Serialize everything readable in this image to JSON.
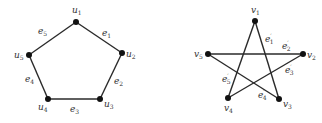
{
  "graphs": [
    {
      "name": "pentagon",
      "nodes": [
        {
          "id": "u1",
          "base": "u",
          "sub": "1",
          "x": 76,
          "y": 22,
          "lx": 72,
          "ly": 13
        },
        {
          "id": "u2",
          "base": "u",
          "sub": "2",
          "x": 122,
          "y": 53,
          "lx": 126,
          "ly": 57
        },
        {
          "id": "u3",
          "base": "u",
          "sub": "3",
          "x": 100,
          "y": 99,
          "lx": 104,
          "ly": 107
        },
        {
          "id": "u4",
          "base": "u",
          "sub": "4",
          "x": 48,
          "y": 99,
          "lx": 38,
          "ly": 110
        },
        {
          "id": "u5",
          "base": "u",
          "sub": "5",
          "x": 29,
          "y": 55,
          "lx": 14,
          "ly": 58
        }
      ],
      "edges": [
        {
          "from": "u1",
          "to": "u2",
          "base": "e",
          "sub": "1",
          "prime": false,
          "lx": 102,
          "ly": 36
        },
        {
          "from": "u2",
          "to": "u3",
          "base": "e",
          "sub": "2",
          "prime": false,
          "lx": 114,
          "ly": 84
        },
        {
          "from": "u3",
          "to": "u4",
          "base": "e",
          "sub": "3",
          "prime": false,
          "lx": 70,
          "ly": 112
        },
        {
          "from": "u4",
          "to": "u5",
          "base": "e",
          "sub": "4",
          "prime": false,
          "lx": 25,
          "ly": 82
        },
        {
          "from": "u5",
          "to": "u1",
          "base": "e",
          "sub": "5",
          "prime": false,
          "lx": 38,
          "ly": 34
        }
      ]
    },
    {
      "name": "pentagram",
      "nodes": [
        {
          "id": "v1",
          "base": "v",
          "sub": "1",
          "x": 255,
          "y": 21,
          "lx": 251,
          "ly": 13
        },
        {
          "id": "v2",
          "base": "v",
          "sub": "2",
          "x": 303,
          "y": 54,
          "lx": 307,
          "ly": 58
        },
        {
          "id": "v3",
          "base": "v",
          "sub": "3",
          "x": 279,
          "y": 99,
          "lx": 283,
          "ly": 107
        },
        {
          "id": "v4",
          "base": "v",
          "sub": "4",
          "x": 228,
          "y": 98,
          "lx": 224,
          "ly": 111
        },
        {
          "id": "v5",
          "base": "v",
          "sub": "5",
          "x": 208,
          "y": 54,
          "lx": 194,
          "ly": 57
        }
      ],
      "edges": [
        {
          "from": "v1",
          "to": "v3",
          "base": "e",
          "sub": "1",
          "prime": true,
          "lx": 265,
          "ly": 42
        },
        {
          "from": "v5",
          "to": "v2",
          "base": "e",
          "sub": "2",
          "prime": true,
          "lx": 282,
          "ly": 49
        },
        {
          "from": "v2",
          "to": "v4",
          "base": "e",
          "sub": "3",
          "prime": true,
          "lx": 285,
          "ly": 73
        },
        {
          "from": "v3",
          "to": "v5",
          "base": "e",
          "sub": "4",
          "prime": true,
          "lx": 258,
          "ly": 98
        },
        {
          "from": "v4",
          "to": "v1",
          "base": "e",
          "sub": "5",
          "prime": true,
          "lx": 222,
          "ly": 82
        }
      ]
    }
  ]
}
